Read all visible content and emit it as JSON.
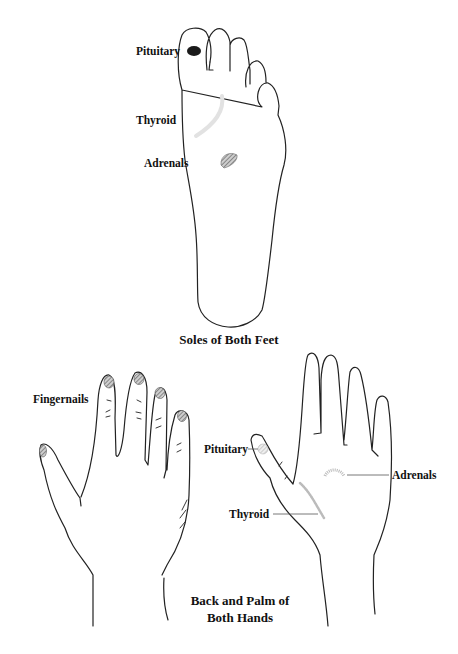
{
  "foot": {
    "caption": "Soles of Both Feet",
    "labels": {
      "pituitary": "Pituitary",
      "thyroid": "Thyroid",
      "adrenals": "Adrenals"
    }
  },
  "hands": {
    "caption_line1": "Back and Palm of",
    "caption_line2": "Both Hands",
    "back_labels": {
      "fingernails": "Fingernails"
    },
    "palm_labels": {
      "pituitary": "Pituitary",
      "thyroid": "Thyroid",
      "adrenals": "Adrenals"
    }
  },
  "colors": {
    "outline": "#222222",
    "pituitary_dot": "#1a1a1a",
    "hatched": "#777777",
    "light_hatch": "#bbbbbb"
  }
}
